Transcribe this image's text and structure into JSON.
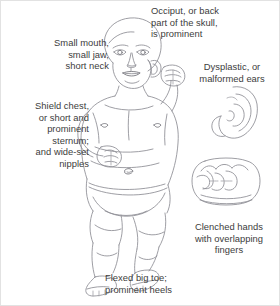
{
  "figure": {
    "line_color": "#8d8d93",
    "line_color_dark": "#6f6f76",
    "text_color": "#3c3c3c",
    "background": "#ffffff",
    "border_color": "#e2e2e2"
  },
  "captions": {
    "occiput": "Occiput, or back\npart of the skull,\nis prominent",
    "mouth": "Small mouth,\nsmall jaw,\nshort neck",
    "ears": "Dysplastic, or\nmalformed ears",
    "chest": "Shield chest,\nor short and\nprominent\nsternum;\nand wide-set\nnipples",
    "hands": "Clenched hands\nwith overlapping\nfingers",
    "toe": "Flexed big toe;\nprominent heels"
  },
  "illustrations": {
    "infant": "infant-full-body-figure",
    "ear_inset": "malformed-ear-detail",
    "fist_inset": "clenched-fist-detail"
  }
}
